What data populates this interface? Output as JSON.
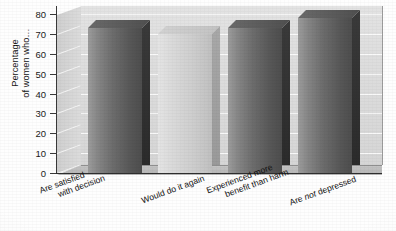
{
  "chart_data": {
    "type": "bar",
    "title": "",
    "xlabel": "",
    "ylabel": "Percentage of women who…",
    "ylim": [
      0,
      80
    ],
    "yticks": [
      0,
      10,
      20,
      30,
      40,
      50,
      60,
      70,
      80
    ],
    "ytick_labels": [
      "0",
      "10",
      "20",
      "30",
      "40",
      "50",
      "60",
      "70",
      "80"
    ],
    "grid": true,
    "legend": "none",
    "style": "3d-bar-grayscale-scan",
    "categories": [
      "Are satisfied with decision",
      "Would do it again",
      "Experienced more benefit than harm",
      "Are not depressed"
    ],
    "values": [
      73,
      70,
      73,
      78
    ],
    "bars": [
      {
        "label_lines": [
          "Are satisfied",
          "with decision"
        ],
        "value": 73,
        "shade": "dark"
      },
      {
        "label_lines": [
          "Would do it again"
        ],
        "value": 70,
        "shade": "light"
      },
      {
        "label_lines": [
          "Experienced more",
          "benefit than harm"
        ],
        "value": 73,
        "shade": "dark"
      },
      {
        "label_lines": [
          "Are not depressed"
        ],
        "value": 78,
        "shade": "dark",
        "italic_word": "not"
      }
    ],
    "colors": {
      "bar_dark": "#6d6d6d",
      "bar_light": "#cfcfcf",
      "back_wall": "#dcdcdc",
      "floor": "#bdbdbd",
      "gridline": "#fbfbfb",
      "axis": "#2e2e2e",
      "text": "#111111"
    }
  },
  "axis": {
    "y_title_line1": "Percentage",
    "y_title_line2": "of women who…"
  }
}
